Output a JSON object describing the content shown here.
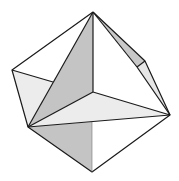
{
  "figure": {
    "colors": {
      "background": "#ffffff",
      "edge": "#1a1a1a",
      "light_face": "#ececec",
      "mid_face": "#c8c8c8",
      "dark_face": "#bdbdbd",
      "white_face": "#ffffff"
    },
    "vertices": {
      "top": [
        93,
        12
      ],
      "left": [
        12,
        70
      ],
      "lower_left": [
        28,
        127
      ],
      "center": [
        93,
        92
      ],
      "right_upper_a": [
        145,
        61
      ],
      "right_upper_b": [
        137,
        67
      ],
      "right": [
        170,
        115
      ],
      "bottom": [
        92,
        172
      ],
      "left_notch": [
        53,
        82
      ],
      "mid_lower": [
        92,
        122
      ]
    }
  }
}
